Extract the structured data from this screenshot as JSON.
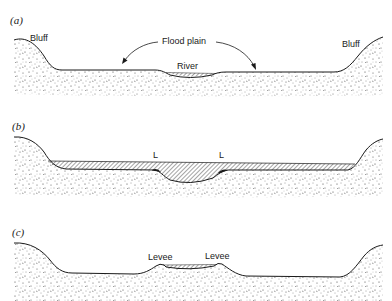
{
  "figure": {
    "panels": [
      {
        "id": "a",
        "label": "(a)",
        "annotations": {
          "bluff_left": "Bluff",
          "bluff_right": "Bluff",
          "flood_plain": "Flood plain",
          "river": "River"
        }
      },
      {
        "id": "b",
        "label": "(b)",
        "annotations": {
          "levee_left": "L",
          "levee_right": "L"
        }
      },
      {
        "id": "c",
        "label": "(c)",
        "annotations": {
          "levee_left": "Levee",
          "levee_right": "Levee"
        }
      }
    ]
  },
  "colors": {
    "ink": "#1a1a1a",
    "stipple": "#3a3a3a",
    "background": "#ffffff"
  }
}
